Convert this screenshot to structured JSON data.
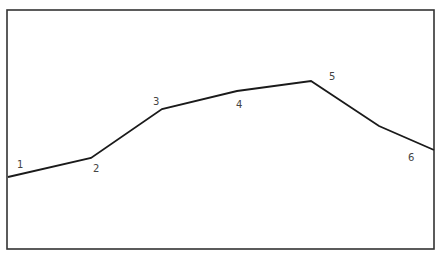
{
  "diagram": {
    "type": "polyline-profile",
    "frame": {
      "x": 7,
      "y": 10,
      "width": 427,
      "height": 239,
      "stroke": "#333333"
    },
    "line_color": "#1a1a1a",
    "label_color": "#444444",
    "vertices": [
      {
        "x": 8,
        "y": 177
      },
      {
        "x": 91,
        "y": 158
      },
      {
        "x": 162,
        "y": 109
      },
      {
        "x": 237,
        "y": 91
      },
      {
        "x": 311,
        "y": 81
      },
      {
        "x": 379,
        "y": 126
      },
      {
        "x": 434,
        "y": 150
      }
    ],
    "labels": [
      {
        "text": "1",
        "x": 17,
        "y": 168
      },
      {
        "text": "2",
        "x": 93,
        "y": 172
      },
      {
        "text": "3",
        "x": 153,
        "y": 105
      },
      {
        "text": "4",
        "x": 236,
        "y": 108
      },
      {
        "text": "5",
        "x": 329,
        "y": 80
      },
      {
        "text": "6",
        "x": 408,
        "y": 161
      }
    ]
  }
}
